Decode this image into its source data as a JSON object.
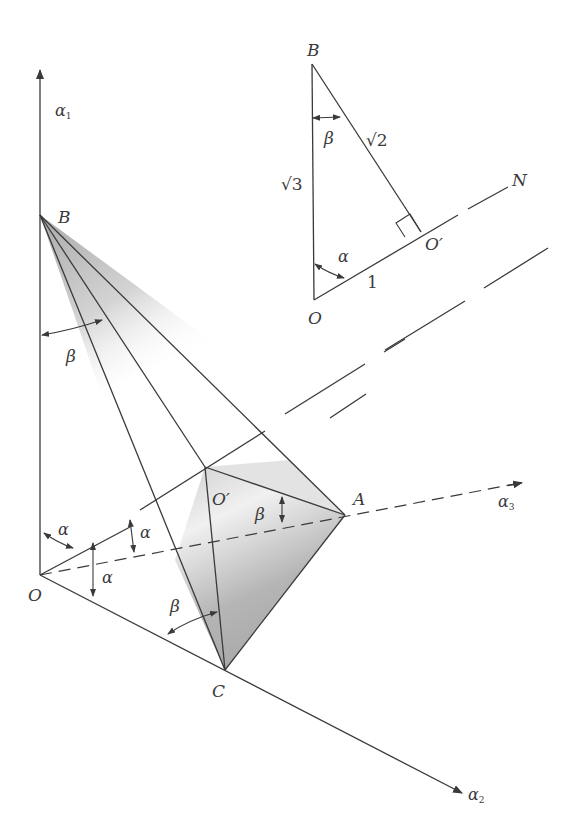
{
  "figure": {
    "fill_color": "#a8a8a8",
    "line_color": "#3a3a3a",
    "main": {
      "axes": {
        "a1": "α",
        "a1_sub": "1",
        "a2": "α",
        "a2_sub": "2",
        "a3": "α",
        "a3_sub": "3"
      },
      "points": {
        "O": "O",
        "B": "B",
        "A": "A",
        "C": "C",
        "O_prime": "O′"
      },
      "angles": {
        "beta_top": "β",
        "beta_A": "β",
        "beta_C": "β",
        "alpha_1": "α",
        "alpha_2": "α",
        "alpha_3": "α"
      }
    },
    "inset": {
      "points": {
        "B": "B",
        "O": "O",
        "O_prime": "O′",
        "N": "N"
      },
      "sides": {
        "OB": "√3",
        "BO_prime": "√2",
        "OO_prime": "1"
      },
      "angles": {
        "beta": "β",
        "alpha": "α"
      }
    }
  }
}
